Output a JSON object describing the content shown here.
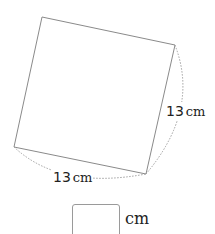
{
  "figure": {
    "shape": "square",
    "corners": {
      "top": [
        42,
        17
      ],
      "right": [
        175,
        45
      ],
      "bottom": [
        146,
        174
      ],
      "left": [
        14,
        147
      ]
    },
    "edge_color": "#8a8a8a",
    "arc_color": "#a0a0a0"
  },
  "labels": {
    "right_side": {
      "value": "13",
      "unit": "cm"
    },
    "bottom_side": {
      "value": "13",
      "unit": "cm"
    }
  },
  "answer": {
    "value": "",
    "unit": "cm"
  }
}
